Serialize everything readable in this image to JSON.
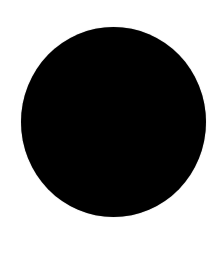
{
  "canvas": {
    "background_color": "#ffffff"
  },
  "shape": {
    "type": "circle",
    "icon": "filled-circle-icon",
    "fill_color": "#000000"
  }
}
